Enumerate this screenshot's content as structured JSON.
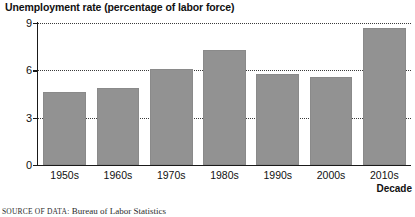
{
  "chart_data": {
    "type": "bar",
    "title": "Unemployment rate (percentage of labor force)",
    "xlabel": "Decade",
    "ylabel": "",
    "categories": [
      "1950s",
      "1960s",
      "1970s",
      "1980s",
      "1990s",
      "2000s",
      "2010s"
    ],
    "values": [
      4.6,
      4.9,
      6.1,
      7.3,
      5.8,
      5.6,
      8.7
    ],
    "ylim": [
      0,
      9
    ],
    "yticks": [
      0,
      3,
      6,
      9
    ],
    "ytick_labels": [
      "0",
      "3",
      "6",
      "9"
    ],
    "grid": "horizontal-dotted",
    "legend": "none",
    "bar_color": "#929292",
    "axis_color": "#1a1a1a",
    "gridline_color": "#3a3a3a"
  },
  "source": {
    "prefix": "SOURCE OF DATA:",
    "text": "Bureau of Labor Statistics"
  }
}
